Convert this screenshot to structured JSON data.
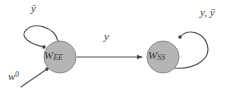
{
  "diagram": {
    "type": "state-transition-graph",
    "background_color": "#ffffff",
    "nodes": [
      {
        "id": "node-left",
        "label": "W",
        "subscript": "EE",
        "label_full": "W_EE",
        "cx": 60,
        "cy": 57,
        "r": 16,
        "fill_color": "#b5b5b5",
        "stroke_color": "#8a8a8a"
      },
      {
        "id": "node-right",
        "label": "W",
        "subscript": "SS",
        "label_full": "W_SS",
        "cx": 163,
        "cy": 57,
        "r": 16,
        "fill_color": "#b5b5b5",
        "stroke_color": "#8a8a8a"
      }
    ],
    "edges": [
      {
        "id": "self-loop-left",
        "from": "node-left",
        "to": "node-left",
        "label": "ȳ",
        "label_text": "y-bar",
        "kind": "self-loop",
        "side": "top-left"
      },
      {
        "id": "edge-left-to-right",
        "from": "node-left",
        "to": "node-right",
        "label": "y",
        "label_text": "y",
        "kind": "straight",
        "side": "horizontal"
      },
      {
        "id": "self-loop-right",
        "from": "node-right",
        "to": "node-right",
        "label": "y, ȳ",
        "label_text": "y, y-bar",
        "kind": "self-loop",
        "side": "top-right"
      },
      {
        "id": "edge-input",
        "from": "external",
        "to": "node-left",
        "label": "w",
        "superscript": "0",
        "label_full": "w^0",
        "kind": "straight",
        "side": "bottom-left"
      }
    ],
    "stroke_color": "#555555",
    "text_color": "#3a3a3a"
  }
}
